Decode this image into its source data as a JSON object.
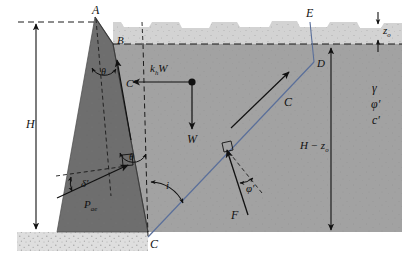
{
  "figure": {
    "type": "engineering-free-body-diagram",
    "width": 402,
    "height": 262
  },
  "colors": {
    "background": "#ffffff",
    "wall_fill": "#6e6e6e",
    "backfill_fill": "#a2a2a2",
    "tension_crack_fill": "#d2d2d2",
    "footing_fill": "#dcdcdc",
    "failure_plane": "#5a6f9a",
    "line": "#111111"
  },
  "points": [
    {
      "id": "A",
      "label": "A",
      "x": 95,
      "y": 17,
      "desc": "top of wall stem"
    },
    {
      "id": "B",
      "label": "B",
      "x": 113,
      "y": 44,
      "desc": "top of backfill at wall face"
    },
    {
      "id": "C",
      "label": "C",
      "x": 148,
      "y": 243,
      "desc": "heel of wall / base of failure plane"
    },
    {
      "id": "D",
      "label": "D",
      "x": 314,
      "y": 65,
      "desc": "failure plane at base of tension crack"
    },
    {
      "id": "E",
      "label": "E",
      "x": 310,
      "y": 19,
      "desc": "top of tension crack at ground surface"
    }
  ],
  "forces": [
    {
      "id": "khW",
      "label": "k",
      "sub": "h",
      "label2": "W",
      "desc": "horizontal pseudo-static inertia force, points left"
    },
    {
      "id": "W",
      "label": "W",
      "desc": "weight of soil wedge, points down"
    },
    {
      "id": "C_adh",
      "label": "C",
      "desc": "cohesion force along failure plane, up-slope"
    },
    {
      "id": "Cprime",
      "label": "C′",
      "desc": "adhesion force along back of wall"
    },
    {
      "id": "F",
      "label": "F",
      "desc": "resultant soil reaction on failure plane"
    },
    {
      "id": "Pae",
      "label": "P",
      "sub": "ae",
      "desc": "dynamic active thrust on wall"
    }
  ],
  "angles": [
    {
      "id": "theta",
      "label": "θ",
      "desc": "wall batter from vertical, shown twice"
    },
    {
      "id": "delta",
      "label": "δ′",
      "desc": "wall friction angle between Pae and normal to wall"
    },
    {
      "id": "phi",
      "label": "φ′",
      "desc": "soil friction angle between F and normal to failure plane"
    },
    {
      "id": "i",
      "label": "i",
      "desc": "failure plane inclination measured from vertical at C"
    }
  ],
  "dimensions": [
    {
      "id": "H",
      "label": "H",
      "desc": "total wall height, left side"
    },
    {
      "id": "Hminuszo",
      "label": "H − z",
      "sub": "o",
      "desc": "height below tension crack, right side"
    },
    {
      "id": "zo",
      "label": "z",
      "sub": "o",
      "desc": "depth of tension crack, upper right"
    }
  ],
  "soil_properties": {
    "items": [
      {
        "id": "gamma",
        "label": "γ"
      },
      {
        "id": "phi",
        "label": "φ′"
      },
      {
        "id": "cprime",
        "label": "c′"
      }
    ]
  }
}
